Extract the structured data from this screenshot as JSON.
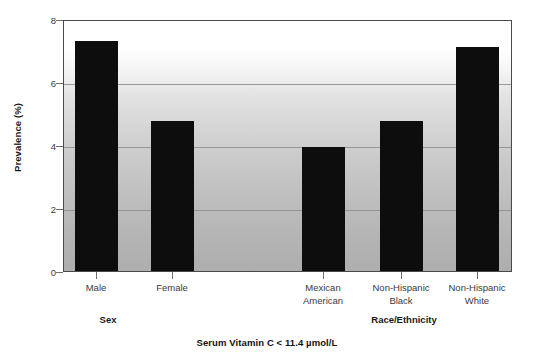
{
  "chart_data": {
    "type": "bar",
    "title": "Serum Vitamin C < 11.4 µmol/L",
    "xlabel": "",
    "ylabel": "Prevalence (%)",
    "ylim": [
      0,
      8
    ],
    "yticks": [
      0,
      2,
      4,
      6,
      8
    ],
    "ytick_labels": [
      "0",
      "2",
      "4",
      "6",
      "8"
    ],
    "grid": "horizontal",
    "legend": "none",
    "categories": [
      "Male",
      "Female",
      "Mexican American",
      "Non-Hispanic Black",
      "Non-Hispanic White"
    ],
    "values": [
      7.3,
      4.75,
      3.95,
      4.75,
      7.1
    ],
    "bars": [
      {
        "label_line1": "Male",
        "label_line2": "",
        "value": 7.3,
        "group": "Sex"
      },
      {
        "label_line1": "Female",
        "label_line2": "",
        "value": 4.75,
        "group": "Sex"
      },
      {
        "label_line1": "Mexican",
        "label_line2": "American",
        "value": 3.95,
        "group": "Race/Ethnicity"
      },
      {
        "label_line1": "Non-Hispanic",
        "label_line2": "Black",
        "value": 4.75,
        "group": "Race/Ethnicity"
      },
      {
        "label_line1": "Non-Hispanic",
        "label_line2": "White",
        "value": 7.1,
        "group": "Race/Ethnicity"
      }
    ],
    "groups": [
      {
        "name": "Sex"
      },
      {
        "name": "Race/Ethnicity"
      }
    ],
    "colors": {
      "bar": "#0d0d0d",
      "axis": "#4a4a4a",
      "gridline": "#8c8c8c",
      "text": "#1a1a1a",
      "tick_text": "#3a3a3a",
      "plot_background_top": "#ffffff",
      "plot_background_bottom": "#aeaeae",
      "figure_background": "#ffffff"
    }
  },
  "axis": {
    "y_title": "Prevalence (%)",
    "ytick_0": "0",
    "ytick_1": "2",
    "ytick_2": "4",
    "ytick_3": "6",
    "ytick_4": "8"
  },
  "groups": {
    "sex": "Sex",
    "race": "Race/Ethnicity"
  },
  "caption": {
    "text": "Serum Vitamin C < 11.4 µmol/L"
  },
  "bar_labels": {
    "b0_l1": "Male",
    "b0_l2": "",
    "b1_l1": "Female",
    "b1_l2": "",
    "b2_l1": "Mexican",
    "b2_l2": "American",
    "b3_l1": "Non-Hispanic",
    "b3_l2": "Black",
    "b4_l1": "Non-Hispanic",
    "b4_l2": "White"
  }
}
